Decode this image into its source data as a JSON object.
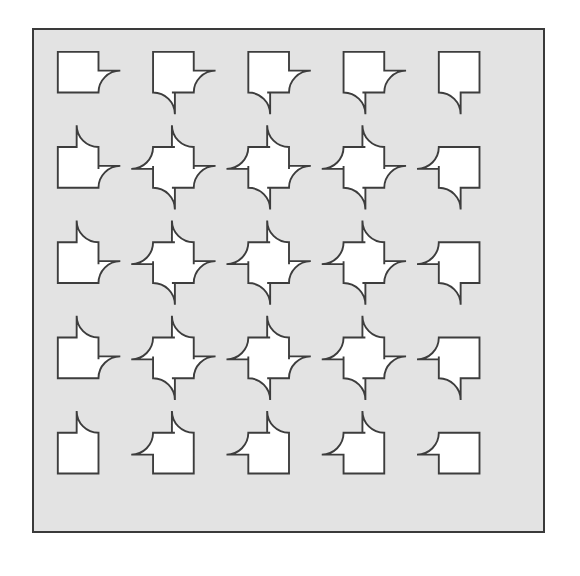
{
  "figure": {
    "title": "Quarter-circle lobed square tiling",
    "caption": "",
    "background_color": "#e3e3e3",
    "page_background_color": "#ffffff",
    "line_color": "#3d3d3d",
    "tile_fill_color": "#ffffff",
    "border_color": "#3a3a3a",
    "frame": {
      "x": 32,
      "y": 28,
      "width": 513,
      "height": 505,
      "border_width": 2
    }
  },
  "chart_data": {
    "type": "diagram",
    "title": "Quarter-circle lobed square tiling",
    "subtitle": "",
    "xlabel": "",
    "ylabel": "",
    "grid": {
      "rows": 5,
      "cols": 5,
      "tile_count": 25,
      "square_side": 41,
      "lobe_radius": 22,
      "pitch_x": 96,
      "pitch_y": 96,
      "origin_x": 24,
      "origin_y": 22
    },
    "legend": [],
    "annotations": [],
    "tiles": [
      {
        "row": 0,
        "col": 0,
        "lobes": [
          "bottom-right"
        ]
      },
      {
        "row": 0,
        "col": 1,
        "lobes": [
          "bottom-left",
          "bottom-right"
        ]
      },
      {
        "row": 0,
        "col": 2,
        "lobes": [
          "bottom-left",
          "bottom-right"
        ]
      },
      {
        "row": 0,
        "col": 3,
        "lobes": [
          "bottom-left",
          "bottom-right"
        ]
      },
      {
        "row": 0,
        "col": 4,
        "lobes": [
          "bottom-left"
        ]
      },
      {
        "row": 1,
        "col": 0,
        "lobes": [
          "top-right",
          "bottom-right"
        ]
      },
      {
        "row": 1,
        "col": 1,
        "lobes": [
          "top-left",
          "top-right",
          "bottom-left",
          "bottom-right"
        ]
      },
      {
        "row": 1,
        "col": 2,
        "lobes": [
          "top-left",
          "top-right",
          "bottom-left",
          "bottom-right"
        ]
      },
      {
        "row": 1,
        "col": 3,
        "lobes": [
          "top-left",
          "top-right",
          "bottom-left",
          "bottom-right"
        ]
      },
      {
        "row": 1,
        "col": 4,
        "lobes": [
          "top-left",
          "bottom-left"
        ]
      },
      {
        "row": 2,
        "col": 0,
        "lobes": [
          "top-right",
          "bottom-right"
        ]
      },
      {
        "row": 2,
        "col": 1,
        "lobes": [
          "top-left",
          "top-right",
          "bottom-left",
          "bottom-right"
        ]
      },
      {
        "row": 2,
        "col": 2,
        "lobes": [
          "top-left",
          "top-right",
          "bottom-left",
          "bottom-right"
        ]
      },
      {
        "row": 2,
        "col": 3,
        "lobes": [
          "top-left",
          "top-right",
          "bottom-left",
          "bottom-right"
        ]
      },
      {
        "row": 2,
        "col": 4,
        "lobes": [
          "top-left",
          "bottom-left"
        ]
      },
      {
        "row": 3,
        "col": 0,
        "lobes": [
          "top-right",
          "bottom-right"
        ]
      },
      {
        "row": 3,
        "col": 1,
        "lobes": [
          "top-left",
          "top-right",
          "bottom-left",
          "bottom-right"
        ]
      },
      {
        "row": 3,
        "col": 2,
        "lobes": [
          "top-left",
          "top-right",
          "bottom-left",
          "bottom-right"
        ]
      },
      {
        "row": 3,
        "col": 3,
        "lobes": [
          "top-left",
          "top-right",
          "bottom-left",
          "bottom-right"
        ]
      },
      {
        "row": 3,
        "col": 4,
        "lobes": [
          "top-left",
          "bottom-left"
        ]
      },
      {
        "row": 4,
        "col": 0,
        "lobes": [
          "top-right"
        ]
      },
      {
        "row": 4,
        "col": 1,
        "lobes": [
          "top-left",
          "top-right"
        ]
      },
      {
        "row": 4,
        "col": 2,
        "lobes": [
          "top-left",
          "top-right"
        ]
      },
      {
        "row": 4,
        "col": 3,
        "lobes": [
          "top-left",
          "top-right"
        ]
      },
      {
        "row": 4,
        "col": 4,
        "lobes": [
          "top-left"
        ]
      }
    ]
  }
}
